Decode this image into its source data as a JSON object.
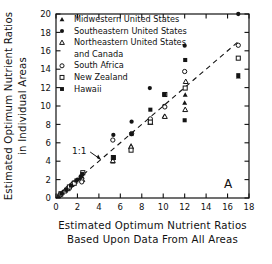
{
  "chart_data": {
    "type": "scatter",
    "title": "",
    "panel_label": "A",
    "xlabel_line1": "Estimated Optimum Nutrient Ratios",
    "xlabel_line2": "Based Upon Data From All Areas",
    "ylabel_line1": "Estimated Optimum Nutrient Ratios",
    "ylabel_line2": "in Individual Areas",
    "xlim": [
      0,
      18
    ],
    "ylim": [
      0,
      20
    ],
    "xticks": [
      0,
      2,
      4,
      6,
      8,
      10,
      12,
      14,
      16,
      18
    ],
    "yticks": [
      0,
      2,
      4,
      6,
      8,
      10,
      12,
      14,
      16,
      18,
      20
    ],
    "grid": false,
    "legend_position": "top-left-inside",
    "reference_line": {
      "label": "1:1",
      "style": "dashed",
      "from": [
        0,
        0
      ],
      "to": [
        17.2,
        17.2
      ],
      "annotation_x": 3.0,
      "annotation_y": 5.0
    },
    "series": [
      {
        "name": "Midwestern United States",
        "marker": "filled-triangle",
        "color": "#141414",
        "points": [
          [
            0.25,
            0.2
          ],
          [
            0.6,
            0.55
          ],
          [
            0.9,
            0.8
          ],
          [
            1.2,
            1.15
          ],
          [
            1.5,
            1.5
          ],
          [
            1.8,
            1.75
          ],
          [
            2.2,
            2.1
          ],
          [
            2.45,
            2.3
          ],
          [
            5.3,
            3.95
          ],
          [
            7.0,
            5.7
          ],
          [
            8.75,
            8.45
          ],
          [
            10.1,
            8.9
          ],
          [
            12.0,
            10.35
          ],
          [
            12.05,
            11.2
          ],
          [
            17.0,
            13.2
          ]
        ]
      },
      {
        "name": "Southeastern United States",
        "marker": "filled-circle",
        "color": "#141414",
        "points": [
          [
            0.3,
            0.3
          ],
          [
            0.7,
            0.7
          ],
          [
            1.05,
            1.05
          ],
          [
            1.35,
            1.35
          ],
          [
            1.65,
            1.7
          ],
          [
            2.0,
            2.0
          ],
          [
            2.3,
            2.35
          ],
          [
            5.35,
            6.85
          ],
          [
            7.05,
            8.3
          ],
          [
            8.75,
            11.95
          ],
          [
            10.1,
            10.0
          ],
          [
            12.0,
            16.55
          ],
          [
            17.0,
            20.0
          ]
        ]
      },
      {
        "name": "Northeastern United States and Canada",
        "marker": "open-triangle",
        "color": "#141414",
        "points": [
          [
            0.35,
            0.35
          ],
          [
            0.8,
            0.75
          ],
          [
            1.1,
            1.0
          ],
          [
            1.45,
            1.45
          ],
          [
            2.45,
            2.0
          ],
          [
            5.3,
            4.05
          ],
          [
            7.0,
            5.55
          ],
          [
            8.8,
            8.2
          ],
          [
            10.15,
            8.85
          ],
          [
            12.05,
            9.6
          ],
          [
            12.1,
            12.65
          ]
        ]
      },
      {
        "name": "South Africa",
        "marker": "open-circle",
        "color": "#141414",
        "points": [
          [
            0.4,
            0.35
          ],
          [
            1.15,
            1.1
          ],
          [
            1.55,
            1.5
          ],
          [
            2.4,
            1.75
          ],
          [
            5.3,
            6.3
          ],
          [
            7.05,
            7.0
          ],
          [
            8.8,
            8.6
          ],
          [
            10.15,
            9.9
          ],
          [
            12.0,
            13.75
          ],
          [
            17.0,
            16.6
          ]
        ]
      },
      {
        "name": "New Zealand",
        "marker": "open-square",
        "color": "#141414",
        "points": [
          [
            0.45,
            0.45
          ],
          [
            1.25,
            1.2
          ],
          [
            1.7,
            1.6
          ],
          [
            2.5,
            2.75
          ],
          [
            5.35,
            4.4
          ],
          [
            7.0,
            5.2
          ],
          [
            8.8,
            8.25
          ],
          [
            10.15,
            11.25
          ],
          [
            12.05,
            11.95
          ],
          [
            17.0,
            15.2
          ]
        ]
      },
      {
        "name": "Hawaii",
        "marker": "filled-square",
        "color": "#141414",
        "points": [
          [
            0.5,
            0.5
          ],
          [
            0.95,
            0.9
          ],
          [
            1.4,
            1.35
          ],
          [
            1.9,
            1.9
          ],
          [
            2.45,
            2.6
          ],
          [
            5.35,
            4.35
          ],
          [
            7.05,
            6.95
          ],
          [
            8.8,
            9.6
          ],
          [
            10.1,
            11.25
          ],
          [
            12.0,
            8.45
          ],
          [
            12.05,
            15.0
          ],
          [
            17.0,
            13.35
          ]
        ]
      }
    ],
    "legend": [
      {
        "label": "Midwestern United States",
        "marker": "filled-triangle"
      },
      {
        "label": "Southeastern United States",
        "marker": "filled-circle"
      },
      {
        "label": "Northeastern United States",
        "marker": "open-triangle"
      },
      {
        "label": "and Canada",
        "marker": "none"
      },
      {
        "label": "South Africa",
        "marker": "open-circle"
      },
      {
        "label": "New Zealand",
        "marker": "open-square"
      },
      {
        "label": "Hawaii",
        "marker": "filled-square"
      }
    ]
  }
}
